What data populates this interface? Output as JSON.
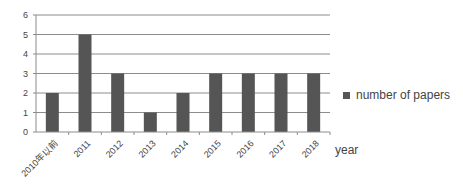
{
  "chart_data": {
    "type": "bar",
    "title": "",
    "xlabel": "year",
    "ylabel": "",
    "categories": [
      "2010年以前",
      "2011",
      "2012",
      "2013",
      "2014",
      "2015",
      "2016",
      "2017",
      "2018"
    ],
    "series": [
      {
        "name": "number of papers",
        "values": [
          2,
          5,
          3,
          1,
          2,
          3,
          3,
          3,
          3
        ],
        "color": "#555555"
      }
    ],
    "ylim": [
      0,
      6
    ],
    "yticks": [
      0,
      1,
      2,
      3,
      4,
      5,
      6
    ],
    "grid": true,
    "legend_position": "right"
  },
  "legend": {
    "label": "number of papers"
  },
  "axis": {
    "xlabel": "year"
  }
}
